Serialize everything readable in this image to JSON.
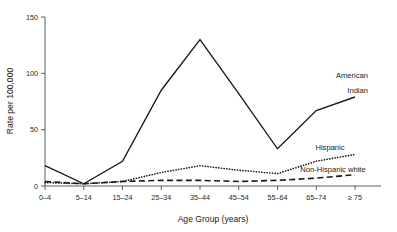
{
  "chart_data": {
    "type": "line",
    "title": "",
    "xlabel": "Age Group (years)",
    "ylabel": "Rate per 100,000",
    "categories": [
      "0–4",
      "5–14",
      "15–24",
      "25–34",
      "35–44",
      "45–54",
      "55–64",
      "65–74",
      "≥ 75"
    ],
    "yticks": [
      "0",
      "50",
      "100",
      "150"
    ],
    "ytick_values": [
      0,
      50,
      100,
      150
    ],
    "ylim": [
      0,
      150
    ],
    "grid": false,
    "legend_position": "inline-annotations",
    "series": [
      {
        "name": "American Indian",
        "style": "solid",
        "values": [
          18,
          2,
          22,
          85,
          130,
          82,
          33,
          67,
          79
        ]
      },
      {
        "name": "Hispanic",
        "style": "dotted",
        "values": [
          3,
          2,
          4,
          12,
          18,
          14,
          11,
          22,
          28
        ]
      },
      {
        "name": "Non-Hispanic white",
        "style": "dashed",
        "values": [
          4,
          2,
          4,
          5,
          5,
          4,
          5,
          7,
          10
        ]
      }
    ],
    "annotations": [
      {
        "text": "American",
        "series": "American Indian",
        "line": 1
      },
      {
        "text": "Indian",
        "series": "American Indian",
        "line": 2
      },
      {
        "text": "Hispanic",
        "series": "Hispanic",
        "line": 1
      },
      {
        "text": "Non-Hispanic white",
        "series": "Non-Hispanic white",
        "line": 1
      }
    ]
  }
}
